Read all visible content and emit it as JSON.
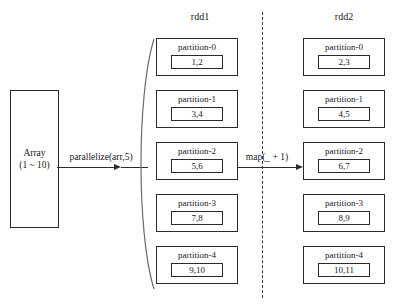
{
  "diagram": {
    "title_left": "rdd1",
    "title_right": "rdd2",
    "source": {
      "name_line": "Array",
      "range_line": "(1 ~ 10)"
    },
    "transforms": {
      "parallelize_label": "parallelize(arr,5)",
      "map_label": "map(_ + 1)"
    },
    "columns": [
      {
        "header": "rdd1",
        "partitions": [
          {
            "label": "partition-0",
            "value": "1,2"
          },
          {
            "label": "partition-1",
            "value": "3,4"
          },
          {
            "label": "partition-2",
            "value": "5,6"
          },
          {
            "label": "partition-3",
            "value": "7,8"
          },
          {
            "label": "partition-4",
            "value": "9,10"
          }
        ]
      },
      {
        "header": "rdd2",
        "partitions": [
          {
            "label": "partition-0",
            "value": "2,3"
          },
          {
            "label": "partition-1",
            "value": "4,5"
          },
          {
            "label": "partition-2",
            "value": "6,7"
          },
          {
            "label": "partition-3",
            "value": "8,9"
          },
          {
            "label": "partition-4",
            "value": "10,11"
          }
        ]
      }
    ],
    "colors": {
      "stroke": "#2b2b2b",
      "background": "#ffffff",
      "divider": "#3a3a3a"
    }
  }
}
